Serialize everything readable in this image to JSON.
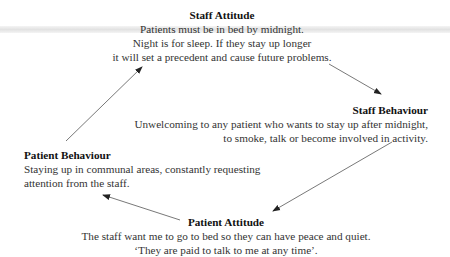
{
  "diagram": {
    "type": "cycle",
    "nodes": [
      {
        "id": "staff-attitude",
        "title": "Staff Attitude",
        "lines": [
          "Patients must be in bed by midnight.",
          "Night is for sleep. If they stay up longer",
          "it will set a precedent and cause future problems."
        ]
      },
      {
        "id": "staff-behaviour",
        "title": "Staff Behaviour",
        "lines": [
          "Unwelcoming to any patient who wants to stay up after midnight,",
          "to smoke, talk or become involved in activity."
        ]
      },
      {
        "id": "patient-attitude",
        "title": "Patient Attitude",
        "lines": [
          "The staff want me to go to bed so they can have peace and quiet.",
          "‘They are paid to talk to me at any time’."
        ]
      },
      {
        "id": "patient-behaviour",
        "title": "Patient Behaviour",
        "lines": [
          "Staying up in communal areas, constantly requesting",
          "attention from the staff."
        ]
      }
    ],
    "edges": [
      {
        "from": "staff-attitude",
        "to": "staff-behaviour"
      },
      {
        "from": "staff-behaviour",
        "to": "patient-attitude"
      },
      {
        "from": "patient-attitude",
        "to": "patient-behaviour"
      },
      {
        "from": "patient-behaviour",
        "to": "staff-attitude"
      }
    ],
    "colors": {
      "arrow": "#555555",
      "text": "#222222",
      "band": "#e2e2e2"
    }
  }
}
